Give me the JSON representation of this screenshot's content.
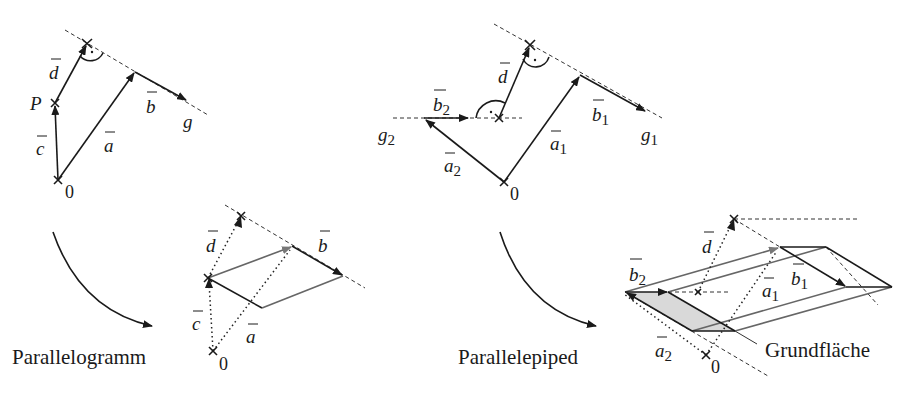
{
  "diagrams": {
    "top_left": {
      "labels": {
        "d": "d",
        "P": "P",
        "c": "c",
        "a": "a",
        "b": "b",
        "g": "g",
        "origin": "0"
      }
    },
    "top_right": {
      "labels": {
        "d": "d",
        "b2": "b",
        "b2_sub": "2",
        "g2": "g",
        "g2_sub": "2",
        "a2": "a",
        "a2_sub": "2",
        "a1": "a",
        "a1_sub": "1",
        "b1": "b",
        "b1_sub": "1",
        "g1": "g",
        "g1_sub": "1",
        "origin": "0"
      }
    },
    "bottom_left": {
      "caption": "Parallelogramm",
      "labels": {
        "d": "d",
        "b": "b",
        "c": "c",
        "a": "a",
        "origin": "0"
      }
    },
    "bottom_right": {
      "caption": "Parallelepiped",
      "base_label": "Grundfläche",
      "labels": {
        "d": "d",
        "b2": "b",
        "b2_sub": "2",
        "a1": "a",
        "a1_sub": "1",
        "b1": "b",
        "b1_sub": "1",
        "a2": "a",
        "a2_sub": "2",
        "origin": "0"
      }
    }
  },
  "colors": {
    "ink": "#1a1a1a",
    "grey_edge": "#666666",
    "base_fill": "#d9d9d9"
  }
}
